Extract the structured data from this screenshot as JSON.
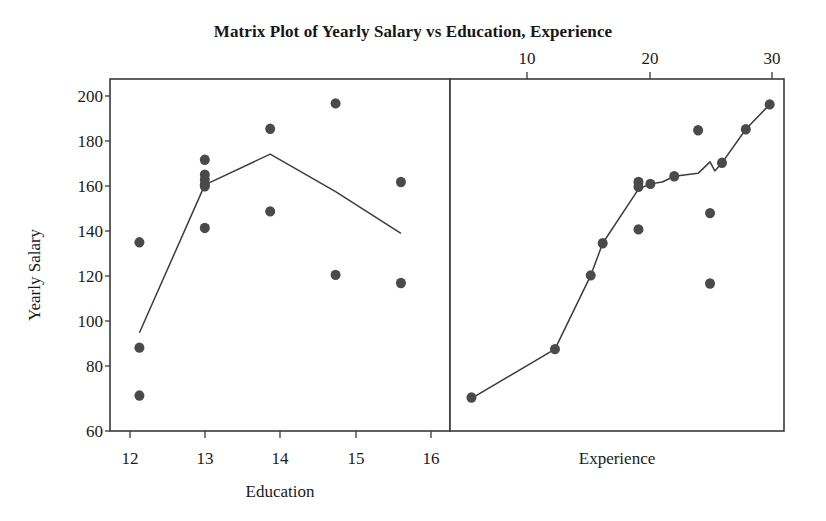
{
  "chart_data": {
    "type": "scatter",
    "title": "Matrix Plot of Yearly Salary vs Education, Experience",
    "ylabel": "Yearly Salary",
    "ylim": [
      60,
      207
    ],
    "yticks": [
      60,
      80,
      100,
      120,
      140,
      160,
      180,
      200
    ],
    "grid": false,
    "legend": null,
    "panels": [
      {
        "id": "education-panel",
        "xlabel": "Education",
        "xlabel_position": "bottom",
        "xaxis_position": "bottom",
        "xlim": [
          11.55,
          16.75
        ],
        "xticks": [
          12,
          13,
          14,
          15,
          16
        ],
        "xtick_labels": [
          "12",
          "13",
          "14",
          "15",
          "16"
        ],
        "series": [
          {
            "name": "Yearly Salary vs Education",
            "type": "scatter",
            "marker": "filled-circle",
            "color": "#4a4a4a",
            "points": [
              {
                "x": 12,
                "y": 138.8
              },
              {
                "x": 12,
                "y": 94.8
              },
              {
                "x": 12,
                "y": 74.8
              },
              {
                "x": 13,
                "y": 173.3
              },
              {
                "x": 13,
                "y": 167.0
              },
              {
                "x": 13,
                "y": 165.0
              },
              {
                "x": 13,
                "y": 163.0
              },
              {
                "x": 13,
                "y": 162.2
              },
              {
                "x": 13,
                "y": 144.8
              },
              {
                "x": 14,
                "y": 186.2
              },
              {
                "x": 14,
                "y": 151.7
              },
              {
                "x": 15,
                "y": 196.8
              },
              {
                "x": 15,
                "y": 125.2
              },
              {
                "x": 16,
                "y": 164.0
              },
              {
                "x": 16,
                "y": 121.8
              }
            ]
          },
          {
            "name": "Mean trend line",
            "type": "line",
            "color": "#3c3c3c",
            "points": [
              {
                "x": 12,
                "y": 101.0
              },
              {
                "x": 13,
                "y": 162.8
              },
              {
                "x": 14,
                "y": 175.6
              },
              {
                "x": 15,
                "y": 160.0
              },
              {
                "x": 16,
                "y": 142.5
              }
            ]
          }
        ]
      },
      {
        "id": "experience-panel",
        "xlabel": "Experience",
        "xlabel_position": "bottom",
        "xaxis_position": "top",
        "xlim": [
          3.2,
          31.2
        ],
        "xticks": [
          10,
          20,
          30
        ],
        "xtick_labels": [
          "10",
          "20",
          "30"
        ],
        "series": [
          {
            "name": "Yearly Salary vs Experience",
            "type": "scatter",
            "marker": "filled-circle",
            "color": "#4a4a4a",
            "points": [
              {
                "x": 5,
                "y": 74.0
              },
              {
                "x": 12,
                "y": 94.2
              },
              {
                "x": 15,
                "y": 125.0
              },
              {
                "x": 16,
                "y": 138.4
              },
              {
                "x": 19,
                "y": 164.0
              },
              {
                "x": 19,
                "y": 162.0
              },
              {
                "x": 19,
                "y": 144.2
              },
              {
                "x": 20,
                "y": 163.2
              },
              {
                "x": 22,
                "y": 166.4
              },
              {
                "x": 24,
                "y": 185.6
              },
              {
                "x": 25,
                "y": 151.0
              },
              {
                "x": 25,
                "y": 121.6
              },
              {
                "x": 26,
                "y": 172.0
              },
              {
                "x": 28,
                "y": 186.0
              },
              {
                "x": 30,
                "y": 196.4
              }
            ]
          },
          {
            "name": "Mean trend line",
            "type": "line",
            "color": "#3c3c3c",
            "points": [
              {
                "x": 5,
                "y": 73.6
              },
              {
                "x": 12,
                "y": 94.2
              },
              {
                "x": 15,
                "y": 125.0
              },
              {
                "x": 16,
                "y": 138.4
              },
              {
                "x": 19,
                "y": 161.0
              },
              {
                "x": 20,
                "y": 163.2
              },
              {
                "x": 21,
                "y": 164.0
              },
              {
                "x": 22,
                "y": 166.4
              },
              {
                "x": 24,
                "y": 167.6
              },
              {
                "x": 25,
                "y": 172.4
              },
              {
                "x": 25.4,
                "y": 168.6
              },
              {
                "x": 26,
                "y": 172.0
              },
              {
                "x": 28,
                "y": 186.0
              },
              {
                "x": 30,
                "y": 196.4
              }
            ]
          }
        ]
      }
    ]
  },
  "style": {
    "frame_color": "#3a3a3a",
    "marker_color": "#4a4a4a",
    "line_color": "#3c3c3c",
    "text_color": "#1a1a1a",
    "background": "#ffffff"
  }
}
